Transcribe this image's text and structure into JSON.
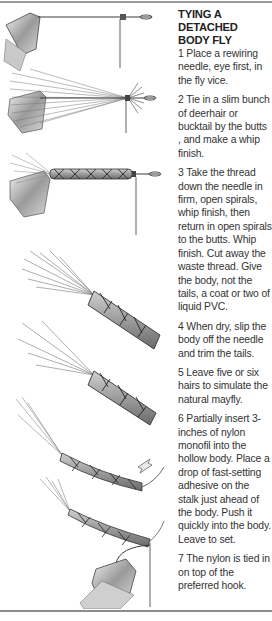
{
  "document": {
    "title_lines": [
      "TYING A",
      "DETACHED",
      "BODY FLY"
    ],
    "steps": [
      {
        "number": "1",
        "text": "1 Place a rewiring needle, eye first, in the fly vice."
      },
      {
        "number": "2",
        "text": "2 Tie in a slim bunch of deerhair or bucktail by the butts , and make a whip finish."
      },
      {
        "number": "3",
        "text": "3 Take the thread down the needle in firm, open spirals, whip finish, then return in open spirals to the butts. Whip finish. Cut away the waste thread. Give the body, not the tails, a coat or two of liquid PVC."
      },
      {
        "number": "4",
        "text": "4 When dry, slip the body off the needle and trim the tails."
      },
      {
        "number": "5",
        "text": "5 Leave five or six hairs to simulate the natural mayfly."
      },
      {
        "number": "6",
        "text": "6 Partially insert 3-inches of nylon monofil into the hollow body. Place a drop of fast-setting adhesive on the stalk just ahead of the body. Push it quickly into the body. Leave to set."
      },
      {
        "number": "7",
        "text": "7 The nylon is tied in on top of the preferred hook."
      }
    ],
    "illustrations": [
      {
        "step": 1,
        "subject": "vice-jaw-with-needle"
      },
      {
        "step": 2,
        "subject": "vice-with-hair-bunch-tied-on-needle"
      },
      {
        "step": 3,
        "subject": "vice-with-thread-spiralled-body-on-needle"
      },
      {
        "step": 4,
        "subject": "detached-body-with-trimmed-tails"
      },
      {
        "step": 5,
        "subject": "detached-body-with-five-hairs"
      },
      {
        "step": 6,
        "subject": "body-with-nylon-monofil-and-arrow"
      },
      {
        "step": 7,
        "subject": "body-tied-on-hook-in-vice"
      }
    ],
    "colors": {
      "rule": "#9a9a9a",
      "text": "#333333",
      "ink": "#3a3a3a"
    }
  }
}
